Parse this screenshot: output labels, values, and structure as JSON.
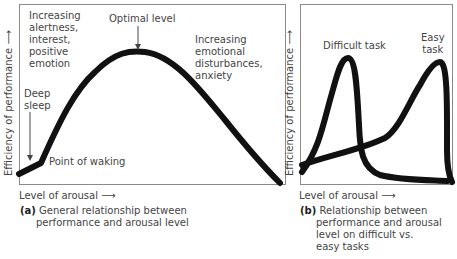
{
  "panel_a": {
    "y_axis_label": "Efficiency of performance",
    "x_axis_label": "Level of arousal",
    "annotations": {
      "optimal": "Optimal level",
      "increasing_alertness": [
        "Increasing",
        "alertness,",
        "interest,",
        "positive",
        "emotion"
      ],
      "increasing_disturbance": [
        "Increasing",
        "emotional",
        "disturbances,",
        "anxiety"
      ],
      "deep_sleep": [
        "Deep",
        "sleep"
      ],
      "point_of_waking": "Point of waking"
    },
    "caption_letter": "(a)",
    "caption": [
      "General relationship between",
      "performance and arousal level"
    ]
  },
  "panel_b": {
    "y_axis_label": "Efficiency of performance",
    "x_axis_label": "Level of arousal",
    "annotations": {
      "difficult": "Difficult task",
      "easy": [
        "Easy",
        "task"
      ]
    },
    "caption_letter": "(b)",
    "caption": [
      "Relationship between",
      "performance and arousal",
      "level on difficult vs.",
      "easy tasks"
    ]
  },
  "colors": {
    "curve": "#111111",
    "frame": "#8a8a8a",
    "text": "#444444"
  }
}
